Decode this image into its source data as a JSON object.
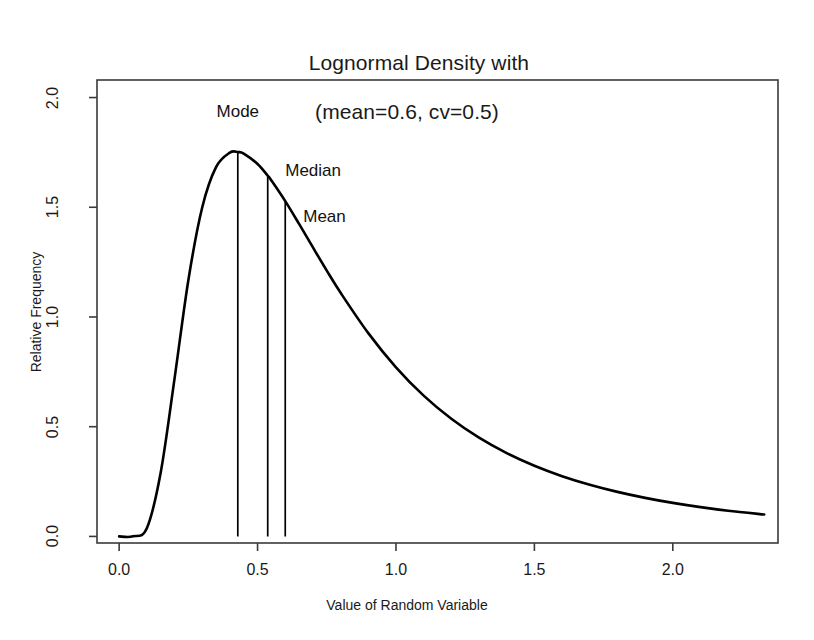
{
  "chart_data": {
    "type": "line",
    "title": "Lognormal Density with (mean=0.6, cv=0.5)",
    "title_line1": "Lognormal Density with",
    "title_line2": "(mean=0.6, cv=0.5)",
    "xlabel": "Value of Random Variable",
    "ylabel": "Relative Frequency",
    "xlim": [
      -0.08,
      2.38
    ],
    "ylim": [
      -0.03,
      2.08
    ],
    "xticks": [
      0.0,
      0.5,
      1.0,
      1.5,
      2.0
    ],
    "xtick_labels": [
      "0.0",
      "0.5",
      "1.0",
      "1.5",
      "2.0"
    ],
    "yticks": [
      0.0,
      0.5,
      1.0,
      1.5,
      2.0
    ],
    "ytick_labels": [
      "0.0",
      "0.5",
      "1.0",
      "1.5",
      "2.0"
    ],
    "grid": false,
    "legend": false,
    "line_color": "#000000",
    "distribution": {
      "name": "lognormal",
      "mean": 0.6,
      "cv": 0.5,
      "sigma": 0.4724,
      "mu": -0.6222
    },
    "series": [
      {
        "name": "Lognormal density",
        "x": [
          0.0,
          0.05,
          0.1,
          0.15,
          0.2,
          0.25,
          0.3,
          0.35,
          0.4,
          0.43,
          0.45,
          0.5,
          0.537,
          0.55,
          0.6,
          0.65,
          0.7,
          0.75,
          0.8,
          0.9,
          1.0,
          1.1,
          1.2,
          1.3,
          1.4,
          1.5,
          1.6,
          1.7,
          1.8,
          1.9,
          2.0,
          2.1,
          2.2,
          2.33
        ],
        "y": [
          0.0,
          0.0003,
          0.0373,
          0.2903,
          0.7181,
          1.1678,
          1.4989,
          1.6828,
          1.7489,
          1.7514,
          1.7446,
          1.6975,
          1.6436,
          1.6221,
          1.528,
          1.4241,
          1.317,
          1.2114,
          1.1102,
          0.9264,
          0.7706,
          0.6417,
          0.536,
          0.4498,
          0.3794,
          0.3218,
          0.2745,
          0.2354,
          0.2029,
          0.1757,
          0.1528,
          0.1335,
          0.1171,
          0.1
        ]
      }
    ],
    "annotations": [
      {
        "label": "Mode",
        "x": 0.4286,
        "y_top": 1.7514,
        "y_bottom": 0.0,
        "label_x": 0.4286,
        "label_y": 1.93,
        "label_anchor": "middle"
      },
      {
        "label": "Median",
        "x": 0.5367,
        "y_top": 1.6436,
        "y_bottom": 0.0,
        "label_x": 0.6,
        "label_y": 1.66,
        "label_anchor": "start"
      },
      {
        "label": "Mean",
        "x": 0.6,
        "y_top": 1.528,
        "y_bottom": 0.0,
        "label_x": 0.665,
        "label_y": 1.45,
        "label_anchor": "start"
      }
    ]
  },
  "figure": {
    "background_color": "#ffffff",
    "frame_color": "#3a3a3a",
    "text_color": "#1a1a1a"
  }
}
